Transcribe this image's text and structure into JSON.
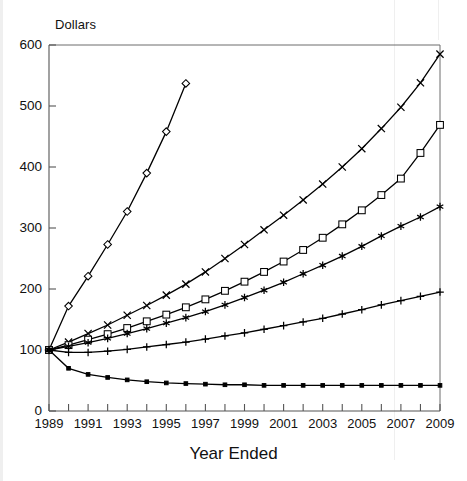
{
  "chart_data": {
    "type": "line",
    "title": "",
    "ylabel": "Dollars",
    "xlabel": "Year Ended",
    "ylim": [
      0,
      600
    ],
    "xlim": [
      1989,
      2009
    ],
    "grid": false,
    "legend": "none",
    "ytick_labels": [
      "0",
      "100",
      "200",
      "300",
      "400",
      "500",
      "600"
    ],
    "ytick_values": [
      0,
      100,
      200,
      300,
      400,
      500,
      600
    ],
    "xtick_values": [
      1989,
      1990,
      1991,
      1992,
      1993,
      1994,
      1995,
      1996,
      1997,
      1998,
      1999,
      2000,
      2001,
      2002,
      2003,
      2004,
      2005,
      2006,
      2007,
      2008,
      2009
    ],
    "xtick_labels": [
      "1989",
      "",
      "1991",
      "",
      "1993",
      "",
      "1995",
      "",
      "1997",
      "",
      "1999",
      "",
      "2001",
      "",
      "2003",
      "",
      "2005",
      "",
      "2007",
      "",
      "2009"
    ],
    "x": [
      1989,
      1990,
      1991,
      1992,
      1993,
      1994,
      1995,
      1996,
      1997,
      1998,
      1999,
      2000,
      2001,
      2002,
      2003,
      2004,
      2005,
      2006,
      2007,
      2008,
      2009
    ],
    "series": [
      {
        "name": "series-diamond",
        "marker": "diamond-open",
        "color": "#000000",
        "x": [
          1989,
          1990,
          1991,
          1992,
          1993,
          1994,
          1995,
          1996
        ],
        "values": [
          100,
          172,
          221,
          273,
          327,
          390,
          458,
          537
        ]
      },
      {
        "name": "series-cross",
        "marker": "x-cross",
        "color": "#000000",
        "x": [
          1989,
          1990,
          1991,
          1992,
          1993,
          1994,
          1995,
          1996,
          1997,
          1998,
          1999,
          2000,
          2001,
          2002,
          2003,
          2004,
          2005,
          2006,
          2007,
          2008,
          2009
        ],
        "values": [
          100,
          113,
          127,
          141,
          157,
          173,
          190,
          208,
          228,
          250,
          273,
          297,
          321,
          346,
          372,
          400,
          430,
          463,
          498,
          538,
          585
        ]
      },
      {
        "name": "series-square",
        "marker": "square-open",
        "color": "#000000",
        "x": [
          1989,
          1990,
          1991,
          1992,
          1993,
          1994,
          1995,
          1996,
          1997,
          1998,
          1999,
          2000,
          2001,
          2002,
          2003,
          2004,
          2005,
          2006,
          2007,
          2008,
          2009
        ],
        "values": [
          100,
          108,
          117,
          126,
          136,
          147,
          158,
          170,
          183,
          197,
          212,
          228,
          245,
          264,
          284,
          306,
          329,
          354,
          381,
          423,
          469
        ]
      },
      {
        "name": "series-asterisk",
        "marker": "asterisk",
        "color": "#000000",
        "x": [
          1989,
          1990,
          1991,
          1992,
          1993,
          1994,
          1995,
          1996,
          1997,
          1998,
          1999,
          2000,
          2001,
          2002,
          2003,
          2004,
          2005,
          2006,
          2007,
          2008,
          2009
        ],
        "values": [
          100,
          106,
          112,
          119,
          127,
          135,
          144,
          153,
          163,
          174,
          186,
          198,
          211,
          225,
          239,
          254,
          270,
          287,
          303,
          318,
          335
        ]
      },
      {
        "name": "series-plus",
        "marker": "plus",
        "color": "#000000",
        "x": [
          1989,
          1990,
          1991,
          1992,
          1993,
          1994,
          1995,
          1996,
          1997,
          1998,
          1999,
          2000,
          2001,
          2002,
          2003,
          2004,
          2005,
          2006,
          2007,
          2008,
          2009
        ],
        "values": [
          100,
          96,
          96,
          98,
          101,
          105,
          109,
          113,
          118,
          123,
          128,
          134,
          140,
          146,
          152,
          159,
          166,
          174,
          181,
          188,
          195
        ]
      },
      {
        "name": "series-dot",
        "marker": "dot-solid",
        "color": "#000000",
        "x": [
          1989,
          1990,
          1991,
          1992,
          1993,
          1994,
          1995,
          1996,
          1997,
          1998,
          1999,
          2000,
          2001,
          2002,
          2003,
          2004,
          2005,
          2006,
          2007,
          2008,
          2009
        ],
        "values": [
          100,
          70,
          60,
          55,
          51,
          48,
          46,
          45,
          44,
          43,
          43,
          42,
          42,
          42,
          42,
          42,
          42,
          42,
          42,
          42,
          42
        ]
      }
    ]
  }
}
